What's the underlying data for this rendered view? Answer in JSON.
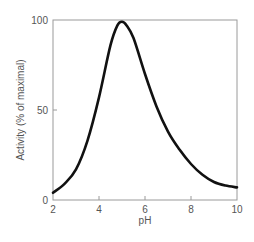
{
  "chart_data": {
    "type": "line",
    "title": "",
    "xlabel": "pH",
    "ylabel": "Activity (% of maximal)",
    "xlim": [
      2,
      10
    ],
    "ylim": [
      0,
      100
    ],
    "x_ticks": [
      2,
      4,
      6,
      8,
      10
    ],
    "y_ticks": [
      0,
      50,
      100
    ],
    "grid": false,
    "legend": null,
    "series": [
      {
        "name": "Enzyme activity",
        "color": "#111111",
        "x": [
          2,
          2.5,
          3,
          3.5,
          4,
          4.5,
          4.8,
          5,
          5.2,
          5.5,
          6,
          6.5,
          7,
          7.5,
          8,
          8.5,
          9,
          9.5,
          10
        ],
        "y": [
          4,
          9,
          17,
          33,
          57,
          86,
          97,
          99,
          97,
          90,
          70,
          52,
          38,
          28,
          20,
          14,
          10,
          8,
          7
        ]
      }
    ]
  }
}
